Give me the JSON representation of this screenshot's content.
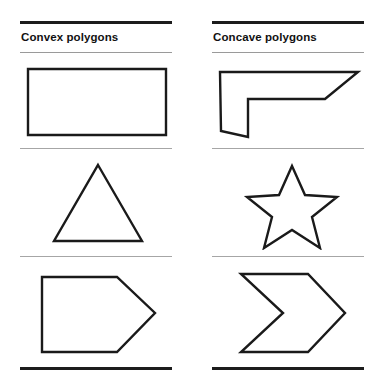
{
  "figure": {
    "background_color": "#ffffff",
    "stroke_color": "#1a1a1a",
    "divider_color": "#a6a6a6",
    "rule_color": "#1c1c1c"
  },
  "columns": [
    {
      "id": "convex",
      "title": "Convex polygons",
      "rows": [
        {
          "shape_name": "rectangle",
          "label": "rectangle"
        },
        {
          "shape_name": "triangle",
          "label": "triangle"
        },
        {
          "shape_name": "pentagon-arrow",
          "label": "pentagon"
        }
      ]
    },
    {
      "id": "concave",
      "title": "Concave polygons",
      "rows": [
        {
          "shape_name": "concave-l-shape",
          "label": "concave L shape"
        },
        {
          "shape_name": "five-point-star",
          "label": "five-pointed star"
        },
        {
          "shape_name": "concave-chevron",
          "label": "chevron"
        }
      ]
    }
  ],
  "geometry": {
    "rectangle": "28,3 166,3 166,69 28,69",
    "triangle": "78,4 122,80 34,80",
    "pentagon": "22,5 97,5 135,41 97,80 22,80",
    "concave_l": "28,5 166,5 133,33 56,33 56,71 29,64",
    "star": "100,2 115,47 162,47 124,75 139,120 100,92 61,120 76,75 38,47 85,47",
    "concave_chevron": "49,4 116,4 153,43 116,82 49,82 91,43"
  }
}
